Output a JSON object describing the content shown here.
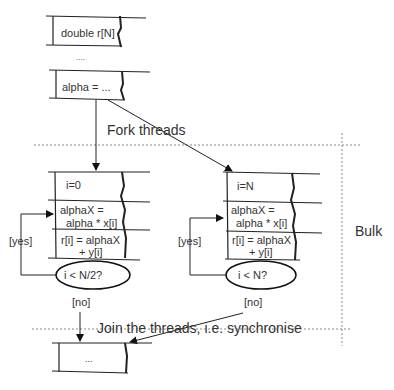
{
  "diagram": {
    "top_box_1": "double r[N]",
    "ellipsis_between": "....",
    "top_box_2": "alpha = ...",
    "fork_label": "Fork threads",
    "bulk_label": "Bulk",
    "thread_left": {
      "init": "i=0",
      "step1_line1": "alphaX =",
      "step1_line2": "alpha * x[i]",
      "step2_line1": "r[i] = alphaX",
      "step2_line2": "+ y[i]",
      "condition": "i < N/2?",
      "yes_label": "[yes]",
      "no_label": "[no]"
    },
    "thread_right": {
      "init": "i=N",
      "step1_line1": "alphaX =",
      "step1_line2": "alpha * x[i]",
      "step2_line1": "r[i] = alphaX",
      "step2_line2": "+ y[i]",
      "condition": "i < N?",
      "yes_label": "[yes]",
      "no_label": "[no]"
    },
    "join_label": "Join the threads, i.e. synchronise",
    "bottom_box": "..."
  }
}
